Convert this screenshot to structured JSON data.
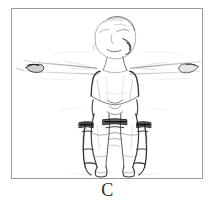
{
  "figure": {
    "caption": "C",
    "alt_description": "Faint pencil sketch, frontal view of a standing person with both arms extended horizontally to the sides, wearing bilateral long leg braces with knee joint hinges",
    "frame": {
      "border_color": "#9b9b9e",
      "background_color": "#ffffff",
      "x": 11,
      "y": 8,
      "width": 192,
      "height": 171
    },
    "ink": {
      "dark_color": "#2a2a2c",
      "mid_color": "#6d6d70",
      "light_color": "#b9b9bc",
      "faint_color": "#d8d8da"
    },
    "subject": {
      "view": "anterior",
      "posture": "standing, arms abducted 90 degrees",
      "parts": [
        "head",
        "neck",
        "left-arm",
        "right-arm",
        "torso",
        "pelvis",
        "left-leg",
        "right-leg",
        "left-foot",
        "right-foot"
      ],
      "orthoses": [
        {
          "name": "left-leg-brace",
          "type": "knee-ankle-foot-orthosis",
          "knee_hinge": true
        },
        {
          "name": "right-leg-brace",
          "type": "knee-ankle-foot-orthosis",
          "knee_hinge": true
        }
      ]
    }
  }
}
